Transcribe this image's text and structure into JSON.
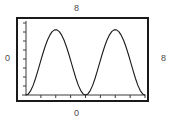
{
  "figure": {
    "labels": {
      "top": "8",
      "left": "0",
      "right": "8",
      "bottom": "0"
    },
    "colors": {
      "frame": "#1a1a1a",
      "curve": "#1a1a1a",
      "axis": "#4a4a4a",
      "label": "#4a4a4a",
      "background": "#ffffff"
    }
  },
  "chart_data": {
    "type": "line",
    "title": "",
    "xlabel": "0",
    "ylabel": "0",
    "top_label": "8",
    "right_label": "8",
    "xlim": [
      0,
      8
    ],
    "ylim": [
      0,
      8
    ],
    "grid": false,
    "legend": null,
    "x_ticks": [
      0,
      1,
      2,
      3,
      4,
      5,
      6,
      7,
      8
    ],
    "y_ticks": [
      0,
      1,
      2,
      3,
      4,
      5,
      6,
      7,
      8
    ],
    "x_tick_labels": [
      "",
      "",
      "",
      "",
      "",
      "",
      "",
      "",
      ""
    ],
    "y_tick_labels": [
      "",
      "",
      "",
      "",
      "",
      "",
      "",
      "",
      ""
    ],
    "series": [
      {
        "name": "curve",
        "description": "two positive humps touching zero at x=0, 4, 8; peaks near 8 at x=2 and x=6",
        "x": [
          0.0,
          0.16,
          0.32,
          0.48,
          0.64,
          0.8,
          0.96,
          1.12,
          1.28,
          1.44,
          1.6,
          1.76,
          1.92,
          2.08,
          2.24,
          2.4,
          2.56,
          2.72,
          2.88,
          3.04,
          3.2,
          3.36,
          3.52,
          3.68,
          3.84,
          4.0,
          4.16,
          4.32,
          4.48,
          4.64,
          4.8,
          4.96,
          5.12,
          5.28,
          5.44,
          5.6,
          5.76,
          5.92,
          6.08,
          6.24,
          6.4,
          6.56,
          6.72,
          6.88,
          7.04,
          7.2,
          7.36,
          7.52,
          7.68,
          7.84,
          8.0
        ],
        "y": [
          0.0,
          0.12,
          0.49,
          1.07,
          1.83,
          2.7,
          3.62,
          4.53,
          5.36,
          6.08,
          6.65,
          7.04,
          7.24,
          7.24,
          7.04,
          6.65,
          6.08,
          5.36,
          4.53,
          3.62,
          2.7,
          1.83,
          1.07,
          0.49,
          0.12,
          0.0,
          0.12,
          0.49,
          1.07,
          1.83,
          2.7,
          3.62,
          4.53,
          5.36,
          6.08,
          6.65,
          7.04,
          7.24,
          7.24,
          7.04,
          6.65,
          6.08,
          5.36,
          4.53,
          3.62,
          2.7,
          1.83,
          1.07,
          0.49,
          0.12,
          0.0
        ]
      }
    ]
  }
}
